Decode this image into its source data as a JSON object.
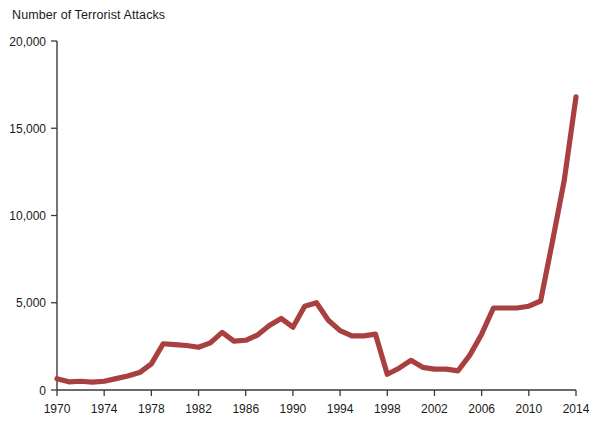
{
  "chart_data": {
    "type": "line",
    "title": "Number of Terrorist Attacks",
    "subtitle": "",
    "xlabel": "",
    "ylabel": "",
    "xlim": [
      1970,
      2014
    ],
    "ylim": [
      0,
      20000
    ],
    "grid": false,
    "legend": false,
    "legend_position": "none",
    "line_color": "#a84040",
    "x_tick_labels": [
      "1970",
      "1974",
      "1978",
      "1982",
      "1986",
      "1990",
      "1994",
      "1998",
      "2002",
      "2006",
      "2010",
      "2014"
    ],
    "x_tick_values": [
      1970,
      1974,
      1978,
      1982,
      1986,
      1990,
      1994,
      1998,
      2002,
      2006,
      2010,
      2014
    ],
    "y_tick_labels": [
      "0",
      "5,000",
      "10,000",
      "15,000",
      "20,000"
    ],
    "y_tick_values": [
      0,
      5000,
      10000,
      15000,
      20000
    ],
    "series": [
      {
        "name": "Number of Terrorist Attacks",
        "color": "#a84040",
        "x": [
          1970,
          1971,
          1972,
          1973,
          1974,
          1975,
          1976,
          1977,
          1978,
          1979,
          1980,
          1981,
          1982,
          1983,
          1984,
          1985,
          1986,
          1987,
          1988,
          1989,
          1990,
          1991,
          1992,
          1993,
          1994,
          1995,
          1996,
          1997,
          1998,
          1999,
          2000,
          2001,
          2002,
          2003,
          2004,
          2005,
          2006,
          2007,
          2008,
          2009,
          2010,
          2011,
          2012,
          2013,
          2014
        ],
        "values": [
          650,
          470,
          500,
          450,
          500,
          650,
          800,
          1000,
          1500,
          2650,
          2600,
          2550,
          2450,
          2700,
          3300,
          2800,
          2850,
          3150,
          3700,
          4100,
          3600,
          4800,
          5000,
          4000,
          3400,
          3100,
          3100,
          3200,
          900,
          1250,
          1700,
          1300,
          1200,
          1200,
          1100,
          2000,
          3200,
          4700,
          4700,
          4700,
          4800,
          5100,
          8500,
          12000,
          16800
        ]
      }
    ]
  }
}
